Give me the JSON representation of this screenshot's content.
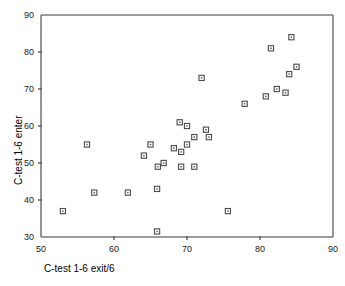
{
  "chart_data": {
    "type": "scatter",
    "title": "",
    "subtitle": "",
    "xlabel": "C-test 1-6 exit/6",
    "ylabel": "C-test 1-6 enter",
    "xlim": [
      50,
      90
    ],
    "ylim": [
      30,
      90
    ],
    "xticks": [
      50,
      60,
      70,
      80,
      90
    ],
    "yticks": [
      30,
      40,
      50,
      60,
      70,
      80,
      90
    ],
    "xtick_labels": [
      "50",
      "60",
      "70",
      "80",
      "90"
    ],
    "ytick_labels": [
      "30",
      "40",
      "50",
      "60",
      "70",
      "80",
      "90"
    ],
    "grid": false,
    "legend": null,
    "legend_position": "none",
    "marker_style": "open-square",
    "marker_color": "#4a4a4a",
    "background_color": "#ffffff",
    "series": [
      {
        "name": "C-test scores",
        "points": [
          [
            53.0,
            37.0
          ],
          [
            56.3,
            55.0
          ],
          [
            57.3,
            42.0
          ],
          [
            61.9,
            42.0
          ],
          [
            64.1,
            52.0
          ],
          [
            65.0,
            55.0
          ],
          [
            65.9,
            43.0
          ],
          [
            65.9,
            31.5
          ],
          [
            66.0,
            49.0
          ],
          [
            66.8,
            50.0
          ],
          [
            68.2,
            54.0
          ],
          [
            69.0,
            61.0
          ],
          [
            69.2,
            53.0
          ],
          [
            69.2,
            49.0
          ],
          [
            70.0,
            60.0
          ],
          [
            70.0,
            55.0
          ],
          [
            71.0,
            57.0
          ],
          [
            71.0,
            49.0
          ],
          [
            72.0,
            73.0
          ],
          [
            72.6,
            59.0
          ],
          [
            73.0,
            57.0
          ],
          [
            75.6,
            37.0
          ],
          [
            77.9,
            66.0
          ],
          [
            80.8,
            68.0
          ],
          [
            81.5,
            81.0
          ],
          [
            82.3,
            70.0
          ],
          [
            83.5,
            69.0
          ],
          [
            84.0,
            74.0
          ],
          [
            84.3,
            84.0
          ],
          [
            85.0,
            76.0
          ]
        ]
      }
    ]
  },
  "axes": {
    "x_label_text": "C-test 1-6 exit/6",
    "y_label_text": "C-test 1-6 enter"
  }
}
